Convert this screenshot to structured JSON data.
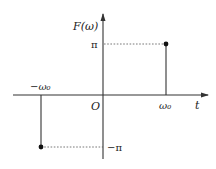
{
  "diagram": {
    "type": "function-plot",
    "y_axis_label": "F(ω)",
    "x_axis_label": "t",
    "origin_label": "O",
    "x_ticks": [
      {
        "label": "−ω₀",
        "value": "-omega0"
      },
      {
        "label": "ω₀",
        "value": "omega0"
      }
    ],
    "y_ticks": [
      {
        "label": "π",
        "value": "pi"
      },
      {
        "label": "−π",
        "value": "-pi"
      }
    ],
    "impulses": [
      {
        "x": "-ω₀",
        "y": "-π"
      },
      {
        "x": "ω₀",
        "y": "π"
      }
    ],
    "colors": {
      "axis": "#333333",
      "stem": "#333333",
      "dashed": "#555555",
      "background": "#ffffff"
    }
  }
}
